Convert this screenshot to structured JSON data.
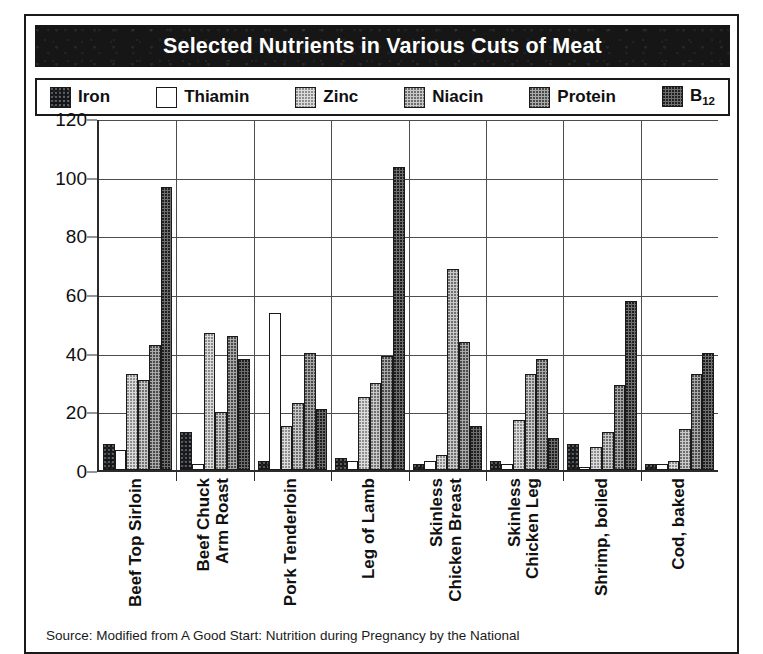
{
  "title": "Selected Nutrients in Various Cuts of Meat",
  "source_note": "Source: Modified from A Good Start: Nutrition during Pregnancy by the National",
  "legend": {
    "items": [
      {
        "label": "Iron",
        "swatch": "fill-iron",
        "color": "#15161a"
      },
      {
        "label": "Thiamin",
        "swatch": "fill-thiamin",
        "color": "#ffffff"
      },
      {
        "label": "Zinc",
        "swatch": "fill-zinc",
        "color": "#dcdcdc"
      },
      {
        "label": "Niacin",
        "swatch": "fill-niacin",
        "color": "#c9c9c9"
      },
      {
        "label": "Protein",
        "swatch": "fill-protein",
        "color": "#a9a9a9"
      },
      {
        "label": "B12",
        "swatch": "fill-b12",
        "color": "#6e6e6e",
        "label_base": "B",
        "label_sub": "12"
      }
    ]
  },
  "chart_data": {
    "type": "bar",
    "title": "Selected Nutrients in Various Cuts of Meat",
    "xlabel": "",
    "ylabel": "",
    "ylim": [
      0,
      120
    ],
    "yticks": [
      0,
      20,
      40,
      60,
      80,
      100,
      120
    ],
    "grid": true,
    "legend_position": "top",
    "categories": [
      "Beef Top Sirloin",
      "Beef Chuck Arm Roast",
      "Pork Tenderloin",
      "Leg of Lamb",
      "Skinless Chicken Breast",
      "Skinless Chicken Leg",
      "Shrimp, boiled",
      "Cod, baked"
    ],
    "category_lines": [
      [
        "Beef Top Sirloin"
      ],
      [
        "Beef Chuck",
        "Arm Roast"
      ],
      [
        "Pork Tenderloin"
      ],
      [
        "Leg of Lamb"
      ],
      [
        "Skinless",
        "Chicken Breast"
      ],
      [
        "Skinless",
        "Chicken Leg"
      ],
      [
        "Shrimp, boiled"
      ],
      [
        "Cod, baked"
      ]
    ],
    "series": [
      {
        "name": "Iron",
        "values": [
          9,
          13,
          3,
          4,
          2,
          3,
          9,
          2
        ]
      },
      {
        "name": "Thiamin",
        "values": [
          7,
          2,
          54,
          3,
          3,
          2,
          1,
          2
        ]
      },
      {
        "name": "Zinc",
        "values": [
          33,
          47,
          15,
          25,
          5,
          17,
          8,
          3
        ]
      },
      {
        "name": "Niacin",
        "values": [
          31,
          20,
          23,
          30,
          69,
          33,
          13,
          14
        ]
      },
      {
        "name": "Protein",
        "values": [
          43,
          46,
          40,
          39,
          44,
          38,
          29,
          33
        ]
      },
      {
        "name": "B12",
        "values": [
          97,
          38,
          21,
          104,
          15,
          11,
          58,
          40
        ]
      }
    ]
  }
}
